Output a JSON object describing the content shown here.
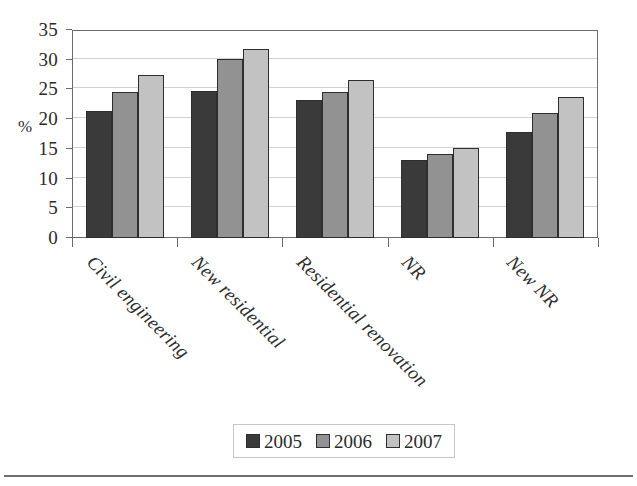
{
  "chart_data": {
    "type": "bar",
    "title": "",
    "subtitle": "",
    "xlabel": "",
    "ylabel": "%",
    "ylim": [
      0,
      35
    ],
    "yticks": [
      0,
      5,
      10,
      15,
      20,
      25,
      30,
      35
    ],
    "ytick_labels": [
      "0",
      "5",
      "10",
      "15",
      "20",
      "25",
      "30",
      "35"
    ],
    "grid": true,
    "legend_position": "bottom-center",
    "categories": [
      "Civil engineering",
      "New residential",
      "Residential renovation",
      "NR",
      "New NR"
    ],
    "series": [
      {
        "name": "2005",
        "color": "#3a3a3a",
        "values": [
          21.3,
          24.7,
          23.2,
          13.2,
          17.8
        ]
      },
      {
        "name": "2006",
        "color": "#929292",
        "values": [
          24.6,
          30.1,
          24.5,
          14.2,
          21.0
        ]
      },
      {
        "name": "2007",
        "color": "#c2c2c2",
        "values": [
          27.4,
          31.8,
          26.6,
          15.2,
          23.7
        ]
      }
    ]
  },
  "axis": {
    "y_title": "%"
  },
  "legend": {
    "entries": [
      {
        "label": "2005"
      },
      {
        "label": "2006"
      },
      {
        "label": "2007"
      }
    ]
  },
  "colors": {
    "series_2005": "#3a3a3a",
    "series_2006": "#929292",
    "series_2007": "#c2c2c2",
    "frame": "#6b6b6b",
    "gridline": "#d2d2d2",
    "bar_outline": "#2e2e2e"
  }
}
